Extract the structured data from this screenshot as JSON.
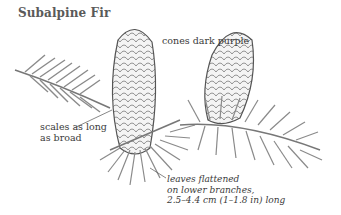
{
  "figure": {
    "title": "Subalpine Fir",
    "background": "#ffffff",
    "ink_color": "#3a3a3a"
  },
  "annotations": {
    "cones": "cones dark purple",
    "scales": [
      "scales as long",
      "as broad"
    ],
    "leaves": [
      "leaves flattened",
      "on lower branches,",
      "2.5–4.4 cm (1–1.8 in) long"
    ]
  },
  "illustration": {
    "subject": "Subalpine fir branch with two upright cones",
    "parts": [
      "left-cone",
      "right-cone",
      "upper-left-branch",
      "lower-right-branch",
      "lower-center-needles"
    ]
  }
}
